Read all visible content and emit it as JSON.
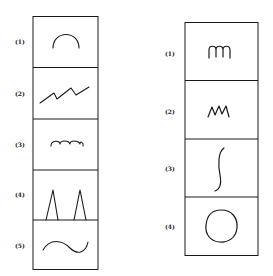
{
  "left_panel": {
    "labels": [
      "(1)",
      "(2)",
      "(3)",
      "(4)",
      "(5)"
    ],
    "shapes": [
      "arch",
      "zigzag-line",
      "triple-bump-scallop",
      "two-peaks",
      "sine-wave"
    ]
  },
  "right_panel": {
    "labels": [
      "(1)",
      "(2)",
      "(3)",
      "(4)"
    ],
    "shapes": [
      "cursive-m",
      "cursive-w-zigzag",
      "integral-s-curve",
      "circle"
    ]
  },
  "colors": {
    "stroke": "#1a1a1a",
    "background": "#ffffff"
  }
}
